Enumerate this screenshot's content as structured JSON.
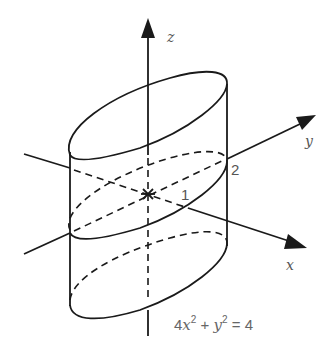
{
  "figure": {
    "axes": {
      "z_label": "z",
      "y_label": "y",
      "x_label": "x"
    },
    "ticks": {
      "y_intercept": "2",
      "x_intercept": "1"
    },
    "equation": {
      "coef": "4",
      "var1": "x",
      "exp1": "2",
      "plus": " + ",
      "var2": "y",
      "exp2": "2",
      "rhs": " = 4"
    },
    "colors": {
      "stroke": "#1a1a1a",
      "label": "#555555"
    }
  }
}
